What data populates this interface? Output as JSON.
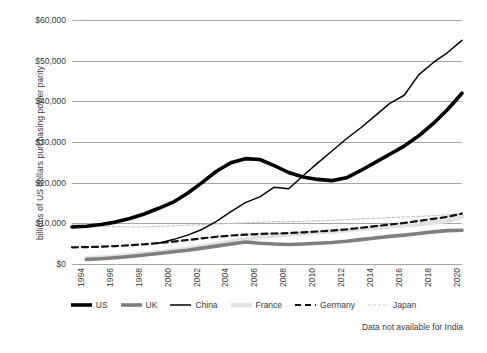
{
  "chart_data": {
    "type": "line",
    "title": "",
    "xlabel": "",
    "ylabel": "billions of US dollars purchasing power parity",
    "xlim": [
      1994,
      2021
    ],
    "ylim": [
      0,
      60000
    ],
    "y_ticks": [
      "$0",
      "$10,000",
      "$20,000",
      "$30,000",
      "$40,000",
      "$50,000",
      "$60,000"
    ],
    "y_tick_values": [
      0,
      10000,
      20000,
      30000,
      40000,
      50000,
      60000
    ],
    "x_ticks": [
      "1994",
      "1996",
      "1998",
      "2000",
      "2002",
      "2004",
      "2006",
      "2008",
      "2010",
      "2012",
      "2014",
      "2016",
      "2018",
      "2020"
    ],
    "x_tick_values": [
      1994,
      1996,
      1998,
      2000,
      2002,
      2004,
      2006,
      2008,
      2010,
      2012,
      2014,
      2016,
      2018,
      2020
    ],
    "grid": true,
    "legend_position": "bottom",
    "annotation": "Data not available for India",
    "series": [
      {
        "name": "US",
        "style": "solid-thick",
        "color": "#000000",
        "width": 3.6,
        "x": [
          1994,
          1995,
          1996,
          1997,
          1998,
          1999,
          2000,
          2001,
          2002,
          2003,
          2004,
          2005,
          2006,
          2007,
          2008,
          2009,
          2010,
          2011,
          2012,
          2013,
          2014,
          2015,
          2016,
          2017,
          2018,
          2019,
          2020,
          2021
        ],
        "values": [
          9100,
          9300,
          9700,
          10300,
          11200,
          12300,
          13700,
          15200,
          17400,
          20000,
          22800,
          24900,
          25900,
          25700,
          24200,
          22500,
          21400,
          20800,
          20500,
          21200,
          23000,
          25000,
          27000,
          29000,
          31500,
          34500,
          38000,
          42000
        ]
      },
      {
        "name": "UK",
        "style": "solid-thick",
        "color": "#7f7f7f",
        "width": 3.6,
        "x": [
          1995,
          1996,
          1997,
          1998,
          1999,
          2000,
          2001,
          2002,
          2003,
          2004,
          2005,
          2006,
          2007,
          2008,
          2009,
          2010,
          2011,
          2012,
          2013,
          2014,
          2015,
          2016,
          2017,
          2018,
          2019,
          2020,
          2021
        ],
        "values": [
          1100,
          1300,
          1550,
          1850,
          2200,
          2600,
          3000,
          3400,
          3900,
          4400,
          4900,
          5400,
          5100,
          4900,
          4800,
          4900,
          5100,
          5300,
          5600,
          6000,
          6400,
          6800,
          7100,
          7500,
          7900,
          8200,
          8300
        ]
      },
      {
        "name": "China",
        "style": "solid-thin",
        "color": "#000000",
        "width": 1.5,
        "x": [
          2000,
          2001,
          2002,
          2003,
          2004,
          2005,
          2006,
          2007,
          2008,
          2009,
          2010,
          2011,
          2012,
          2013,
          2014,
          2015,
          2016,
          2017,
          2018,
          2019,
          2020,
          2021
        ],
        "values": [
          5100,
          6000,
          7100,
          8500,
          10500,
          12900,
          15100,
          16500,
          18900,
          18500,
          21700,
          24800,
          27800,
          30800,
          33500,
          36500,
          39500,
          41500,
          46500,
          49500,
          52000,
          55000
        ]
      },
      {
        "name": "France",
        "style": "solid-thick",
        "color": "#e2e2e2",
        "width": 4.5,
        "x": [
          1995,
          1996,
          1997,
          1998,
          1999,
          2000,
          2001,
          2002,
          2003,
          2004,
          2005,
          2006,
          2007,
          2008,
          2009,
          2010,
          2011,
          2012,
          2013,
          2014,
          2015,
          2016,
          2017,
          2018,
          2019,
          2020,
          2021
        ],
        "values": [
          1400,
          1600,
          1850,
          2150,
          2500,
          2900,
          3350,
          3800,
          4300,
          4900,
          5500,
          6100,
          6600,
          7000,
          7200,
          7500,
          7800,
          8000,
          8300,
          8600,
          8900,
          9200,
          9500,
          9800,
          10200,
          10600,
          11600
        ]
      },
      {
        "name": "Germany",
        "style": "dashed",
        "color": "#111111",
        "width": 2.2,
        "x": [
          1994,
          1995,
          1996,
          1997,
          1998,
          1999,
          2000,
          2001,
          2002,
          2003,
          2004,
          2005,
          2006,
          2007,
          2008,
          2009,
          2010,
          2011,
          2012,
          2013,
          2014,
          2015,
          2016,
          2017,
          2018,
          2019,
          2020,
          2021
        ],
        "values": [
          4100,
          4150,
          4250,
          4400,
          4600,
          4850,
          5150,
          5500,
          5900,
          6300,
          6700,
          7000,
          7200,
          7400,
          7500,
          7600,
          7800,
          8000,
          8200,
          8500,
          8900,
          9300,
          9700,
          10100,
          10600,
          11100,
          11600,
          12400
        ]
      },
      {
        "name": "Japan",
        "style": "dotted-thin",
        "color": "#c9c9c9",
        "width": 1.2,
        "x": [
          1994,
          1995,
          1996,
          1997,
          1998,
          1999,
          2000,
          2001,
          2002,
          2003,
          2004,
          2005,
          2006,
          2007,
          2008,
          2009,
          2010,
          2011,
          2012,
          2013,
          2014,
          2015,
          2016,
          2017,
          2018,
          2019,
          2020,
          2021
        ],
        "values": [
          9700,
          9500,
          9300,
          9200,
          9150,
          9150,
          9250,
          9400,
          9550,
          9700,
          9850,
          10000,
          10150,
          10300,
          10400,
          10400,
          10500,
          10600,
          10700,
          10900,
          11100,
          11250,
          11400,
          11550,
          11700,
          11900,
          12100,
          12400
        ]
      }
    ]
  },
  "legend": {
    "items": [
      {
        "label": "US",
        "key": "US"
      },
      {
        "label": "UK",
        "key": "UK"
      },
      {
        "label": "China",
        "key": "China"
      },
      {
        "label": "France",
        "key": "France"
      },
      {
        "label": "Germany",
        "key": "Germany"
      },
      {
        "label": "Japan",
        "key": "Japan"
      }
    ]
  },
  "note": "Data not available for India"
}
